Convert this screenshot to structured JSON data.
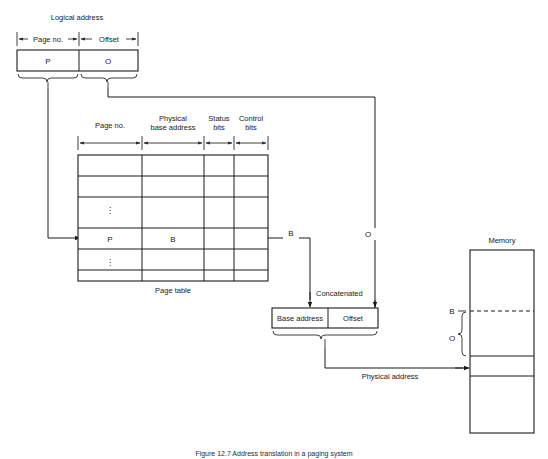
{
  "figure": {
    "caption": "Figure 12.7  Address translation in a paging system",
    "title": "Address translation in a paging system"
  },
  "logical_address": {
    "title": "Logical address",
    "field_labels": [
      "Page no.",
      "Offset"
    ],
    "cells": [
      "P",
      "O"
    ]
  },
  "page_table": {
    "title": "Page table",
    "column_headers": [
      "Page no.",
      "Physical base address",
      "Status bits",
      "Control bits"
    ],
    "column_header_lines": [
      [
        "Page no."
      ],
      [
        "Physical",
        "base address"
      ],
      [
        "Status",
        "bits"
      ],
      [
        "Control",
        "bits"
      ]
    ],
    "rows": [
      {
        "page_no": "",
        "base": "",
        "status": "",
        "control": ""
      },
      {
        "page_no": "",
        "base": "",
        "status": "",
        "control": ""
      },
      {
        "page_no": "⋮",
        "base": "",
        "status": "",
        "control": ""
      },
      {
        "page_no": "P",
        "base": "B",
        "status": "",
        "control": ""
      },
      {
        "page_no": "⋮",
        "base": "",
        "status": "",
        "control": ""
      },
      {
        "page_no": "",
        "base": "",
        "status": "",
        "control": ""
      }
    ]
  },
  "signals": {
    "base_out": "B",
    "offset_out": "O",
    "concatenated": "Concatenated",
    "physical_address": "Physical address"
  },
  "physical_address_box": {
    "cells": [
      "Base address",
      "Offset"
    ]
  },
  "memory": {
    "title": "Memory",
    "marker_base": "B",
    "marker_offset": "O"
  },
  "colors": {
    "stroke": "#1a1a1a",
    "thin_stroke": "#2b2b2b",
    "background": "#ffffff"
  }
}
